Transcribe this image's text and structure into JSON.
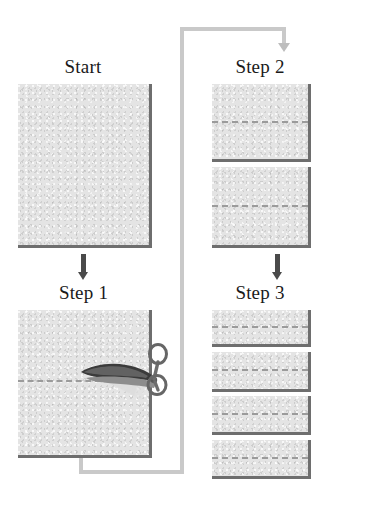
{
  "diagram": {
    "background_color": "#ffffff",
    "paper_fill_color": "#e4e4e4",
    "paper_shadow_color": "#6e6e6e",
    "dash_color": "#9b9b9b",
    "arrow_color": "#4a4a4a",
    "loop_color": "#c9c9c9"
  },
  "panels": [
    {
      "id": "start",
      "label": "Start",
      "sheet_count": 1,
      "dashed_lines": 0,
      "has_scissors": false
    },
    {
      "id": "step-1",
      "label": "Step 1",
      "sheet_count": 1,
      "dashed_lines": 1,
      "has_scissors": true
    },
    {
      "id": "step-2",
      "label": "Step 2",
      "sheet_count": 2,
      "dashed_lines": 2,
      "has_scissors": false
    },
    {
      "id": "step-3",
      "label": "Step 3",
      "sheet_count": 4,
      "dashed_lines": 4,
      "has_scissors": false
    }
  ],
  "arrows": [
    {
      "id": "start-to-step-1",
      "from": "start",
      "to": "step-1",
      "style": "solid-dark",
      "direction": "down"
    },
    {
      "id": "step-2-to-step-3",
      "from": "step-2",
      "to": "step-3",
      "style": "solid-dark",
      "direction": "down"
    },
    {
      "id": "step-1-to-step-2",
      "from": "step-1",
      "to": "step-2",
      "style": "loop-gray",
      "direction": "down"
    }
  ],
  "icons": {
    "scissors": "scissors-icon",
    "arrow_down": "arrow-down-icon"
  }
}
